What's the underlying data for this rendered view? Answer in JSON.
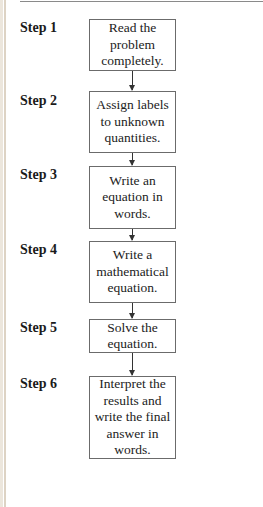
{
  "flowchart": {
    "steps": [
      {
        "label": "Step 1",
        "text": "Read the\nproblem\ncompletely."
      },
      {
        "label": "Step 2",
        "text": "Assign labels\nto unknown\nquantities."
      },
      {
        "label": "Step 3",
        "text": "Write an\nequation in\nwords."
      },
      {
        "label": "Step 4",
        "text": "Write a\nmathematical\nequation."
      },
      {
        "label": "Step 5",
        "text": "Solve the\nequation."
      },
      {
        "label": "Step 6",
        "text": "Interpret the\nresults and\nwrite the final\nanswer in\nwords."
      }
    ],
    "colors": {
      "box_border": "#6b6b6b",
      "arrow": "#333333",
      "page_edge": "#ece6dc"
    }
  }
}
